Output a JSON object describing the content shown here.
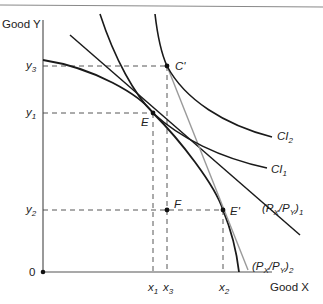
{
  "diagram": {
    "title": "",
    "axes": {
      "y_label": "Good Y",
      "x_label": "Good X",
      "origin_label": "0"
    },
    "y_ticks": [
      {
        "id": "y3",
        "base": "y",
        "sub": "3"
      },
      {
        "id": "y1",
        "base": "y",
        "sub": "1"
      },
      {
        "id": "y2",
        "base": "y",
        "sub": "2"
      }
    ],
    "x_ticks": [
      {
        "id": "x1",
        "base": "x",
        "sub": "1"
      },
      {
        "id": "x3",
        "base": "x",
        "sub": "3"
      },
      {
        "id": "x2",
        "base": "x",
        "sub": "2"
      }
    ],
    "points": {
      "E": "E",
      "C_prime": "C'",
      "F": "F",
      "E_prime": "E'"
    },
    "curves": {
      "ci1": {
        "base": "CI",
        "sub": "1"
      },
      "ci2": {
        "base": "CI",
        "sub": "2"
      },
      "price_line_1": {
        "open": "(P",
        "sx": "X",
        "mid": "/P",
        "sy": "Y",
        "close": ")",
        "sub": "1"
      },
      "price_line_2": {
        "open": "(P",
        "sx": "X",
        "mid": "/P",
        "sy": "Y",
        "close": ")",
        "sub": "2"
      }
    },
    "colors": {
      "axis": "#555555",
      "curve": "#1a1a1a",
      "price_line_2": "#9a9a9a",
      "dashed": "#444444",
      "top_rule": "#888888"
    }
  }
}
